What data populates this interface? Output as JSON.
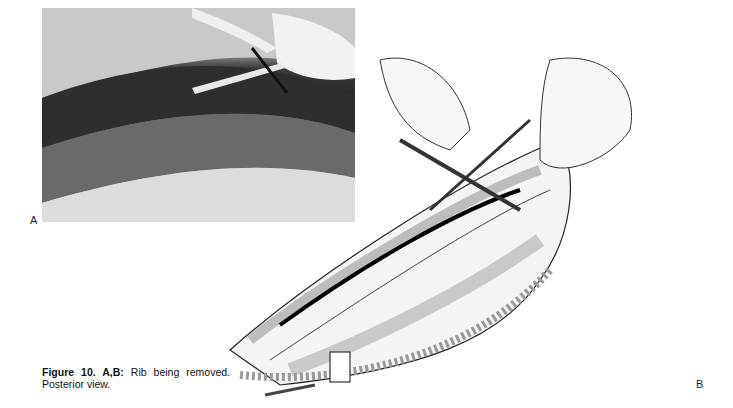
{
  "figure": {
    "panels": [
      {
        "label": "A",
        "type": "photograph",
        "description": "Black-and-white intraoperative photograph of rib removal with gloved hands holding instruments"
      },
      {
        "label": "B",
        "type": "illustration",
        "description": "Line drawing of hands using rib instruments to remove a rib through posterior incision, posterior view"
      }
    ],
    "caption": {
      "prefix": "Figure 10. A,B:",
      "text": "Rib being removed. Posterior view."
    }
  }
}
